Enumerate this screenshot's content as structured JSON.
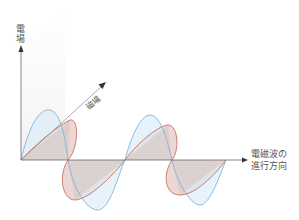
{
  "diagram": {
    "labels": {
      "electric_field": "電場",
      "magnetic_field": "磁場",
      "propagation_line1": "電磁波の",
      "propagation_line2": "進行方向"
    },
    "colors": {
      "electric_wave_stroke": "#7fb3dc",
      "electric_wave_fill": "#d6ebf8",
      "magnetic_wave_stroke": "#c8705f",
      "magnetic_wave_fill": "#f6d9d0",
      "overlap_fill": "#d7c7c4",
      "axis": "#444444",
      "plane": "#f2f2f2"
    },
    "geometry": {
      "origin": [
        21,
        160
      ],
      "axis_end_x": 247,
      "axis_end_y": 45,
      "diag_end": [
        105,
        82
      ],
      "wavelength": 105
    }
  }
}
